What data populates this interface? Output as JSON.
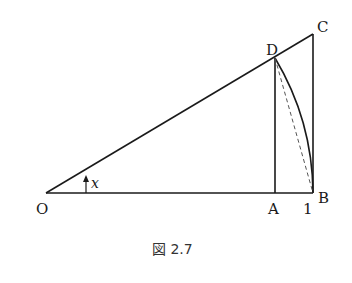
{
  "figure": {
    "caption": "図 2.7",
    "points": {
      "O": {
        "label": "O"
      },
      "A": {
        "label": "A"
      },
      "B": {
        "label": "B"
      },
      "C": {
        "label": "C"
      },
      "D": {
        "label": "D"
      }
    },
    "tick_label": "1",
    "angle_label": "x",
    "colors": {
      "line": "#1a1a1a",
      "dashed": "#555555",
      "background": "#ffffff"
    }
  }
}
